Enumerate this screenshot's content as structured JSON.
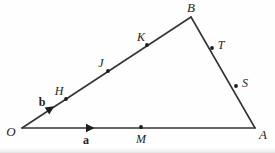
{
  "figure": {
    "background_color": "#fefefe",
    "stroke_color": "#343434",
    "stroke_width": 1.6,
    "dot_color": "#1d1d1d",
    "dot_radius": 1.9,
    "width": 275,
    "height": 153
  },
  "vertices": [
    {
      "id": "O",
      "label": "O",
      "x": 22,
      "y": 128,
      "label_x": 11,
      "label_y": 131
    },
    {
      "id": "A",
      "label": "A",
      "x": 255,
      "y": 128,
      "label_x": 263,
      "label_y": 134
    },
    {
      "id": "B",
      "label": "B",
      "x": 191,
      "y": 17,
      "label_x": 191,
      "label_y": 7
    }
  ],
  "edges": [
    {
      "id": "OA",
      "from": "O",
      "to": "A",
      "x1": 22,
      "y1": 128,
      "x2": 255,
      "y2": 128
    },
    {
      "id": "OB",
      "from": "O",
      "to": "B",
      "x1": 22,
      "y1": 128,
      "x2": 191,
      "y2": 17
    },
    {
      "id": "BA",
      "from": "B",
      "to": "A",
      "x1": 191,
      "y1": 17,
      "x2": 255,
      "y2": 128
    }
  ],
  "points": [
    {
      "id": "H",
      "label": "H",
      "edge": "OB",
      "x": 66,
      "y": 99,
      "label_x": 59,
      "label_y": 91
    },
    {
      "id": "J",
      "label": "J",
      "edge": "OB",
      "x": 108,
      "y": 71,
      "label_x": 101,
      "label_y": 63
    },
    {
      "id": "K",
      "label": "K",
      "edge": "OB",
      "x": 147,
      "y": 45,
      "label_x": 141,
      "label_y": 37
    },
    {
      "id": "T",
      "label": "T",
      "edge": "BA",
      "x": 212,
      "y": 48,
      "label_x": 221,
      "label_y": 45
    },
    {
      "id": "S",
      "label": "S",
      "edge": "BA",
      "x": 236,
      "y": 86,
      "label_x": 245,
      "label_y": 83
    },
    {
      "id": "M",
      "label": "M",
      "edge": "OA",
      "x": 141,
      "y": 127,
      "label_x": 141,
      "label_y": 139
    }
  ],
  "vectors": [
    {
      "id": "a",
      "label": "a",
      "edge": "OA",
      "arrow_x": 86,
      "arrow_y": 128,
      "angle_deg": 0,
      "label_x": 86,
      "label_y": 140
    },
    {
      "id": "b",
      "label": "b",
      "edge": "OB",
      "arrow_x": 47,
      "arrow_y": 111,
      "angle_deg": -33.3,
      "label_x": 42,
      "label_y": 102
    }
  ],
  "tick_marks": [
    {
      "id": "tick-H",
      "x": 66,
      "y": 99,
      "angle_deg": -33.3
    },
    {
      "id": "tick-J",
      "x": 108,
      "y": 71,
      "angle_deg": -33.3
    },
    {
      "id": "tick-K",
      "x": 147,
      "y": 45,
      "angle_deg": -33.3
    },
    {
      "id": "tick-T",
      "x": 212,
      "y": 48,
      "angle_deg": 60.0
    },
    {
      "id": "tick-S",
      "x": 236,
      "y": 86,
      "angle_deg": 60.0
    }
  ]
}
